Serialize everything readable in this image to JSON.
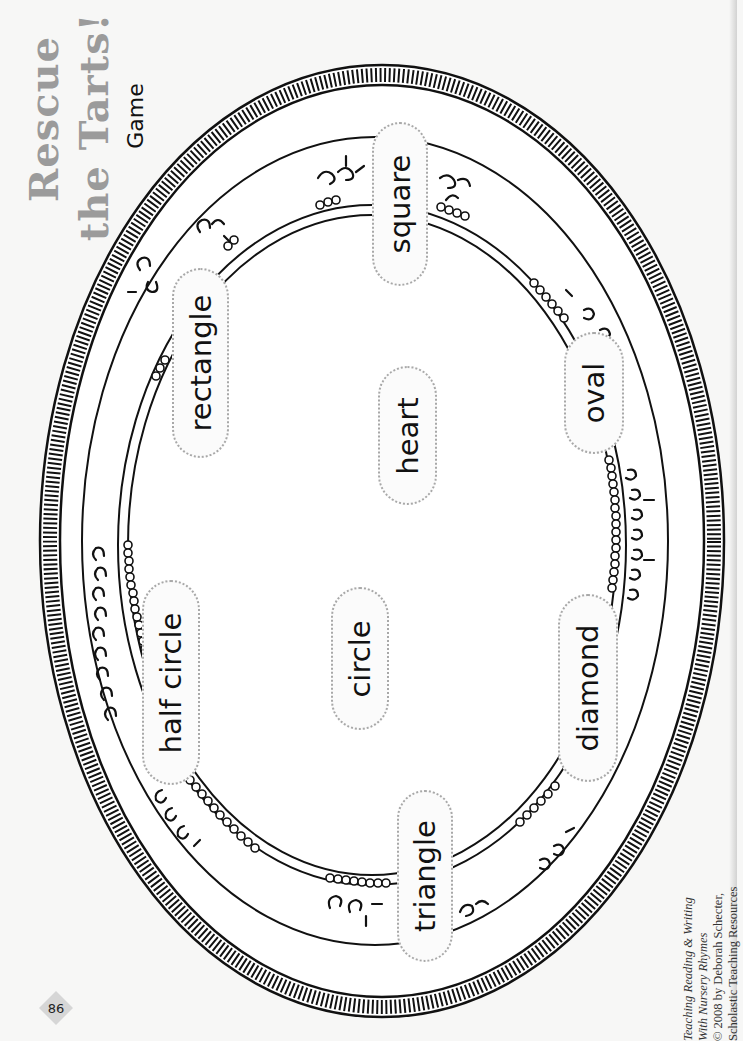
{
  "title": {
    "line1": "Rescue",
    "line2": "the Tarts!",
    "subtitle": "Game",
    "color": "#9b9b9b"
  },
  "platter": {
    "rim_color": "#111111",
    "labels": [
      {
        "text": "square",
        "x": 372,
        "y": 122,
        "w": 56,
        "h": 164
      },
      {
        "text": "rectangle",
        "x": 172,
        "y": 268,
        "w": 57,
        "h": 190
      },
      {
        "text": "oval",
        "x": 564,
        "y": 332,
        "w": 60,
        "h": 122
      },
      {
        "text": "heart",
        "x": 378,
        "y": 366,
        "w": 59,
        "h": 139
      },
      {
        "text": "half circle",
        "x": 142,
        "y": 580,
        "w": 58,
        "h": 205
      },
      {
        "text": "circle",
        "x": 331,
        "y": 587,
        "w": 58,
        "h": 143
      },
      {
        "text": "diamond",
        "x": 558,
        "y": 594,
        "w": 60,
        "h": 188
      },
      {
        "text": "triangle",
        "x": 397,
        "y": 790,
        "w": 56,
        "h": 172
      }
    ]
  },
  "footer": {
    "page_number": "86",
    "credits": [
      {
        "text": "Teaching Reading & Writing",
        "italic": true
      },
      {
        "text": "With Nursery Rhymes",
        "italic": true
      },
      {
        "text": "© 2008 by Deborah Schecter,",
        "italic": false
      },
      {
        "text": "Scholastic Teaching Resources",
        "italic": false
      }
    ]
  }
}
